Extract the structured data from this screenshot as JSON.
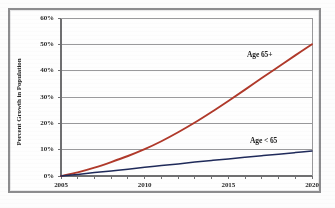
{
  "chart_data": {
    "type": "line",
    "title": "",
    "subtitle": "",
    "xlabel": "",
    "ylabel": "Percent Growth in Population",
    "xlim": [
      2005,
      2020
    ],
    "ylim": [
      0,
      60
    ],
    "grid": true,
    "grid_axis": "y",
    "legend_position": "inline-annotation",
    "x_tick_labels": [
      "2005",
      "2010",
      "2015",
      "2020"
    ],
    "x_tick_values": [
      2005,
      2010,
      2015,
      2020
    ],
    "y_tick_labels": [
      "0%",
      "10%",
      "20%",
      "30%",
      "40%",
      "50%",
      "60%"
    ],
    "y_tick_values": [
      0,
      10,
      20,
      30,
      40,
      50,
      60
    ],
    "y_unit": "%",
    "x": [
      2005,
      2006,
      2007,
      2008,
      2009,
      2010,
      2011,
      2012,
      2013,
      2014,
      2015,
      2016,
      2017,
      2018,
      2019,
      2020
    ],
    "series": [
      {
        "name": "Age 65+",
        "color": "#b0392a",
        "annotation": "Age 65+",
        "values": [
          0,
          1.4,
          3.2,
          5.3,
          7.6,
          10.2,
          13.2,
          16.6,
          20.3,
          24.3,
          28.5,
          32.8,
          37.2,
          41.5,
          45.8,
          50.0
        ]
      },
      {
        "name": "Age < 65",
        "color": "#1f2a5a",
        "annotation": "Age < 65",
        "values": [
          0,
          0.6,
          1.3,
          1.9,
          2.6,
          3.3,
          4.0,
          4.6,
          5.3,
          5.9,
          6.5,
          7.1,
          7.7,
          8.3,
          8.9,
          9.5
        ]
      }
    ]
  },
  "figure": {
    "frame_color": "#8d8d8f",
    "plot_background": "#ffffff",
    "gridline_color": "#9a9a9c",
    "axis_color": "#6f6f71",
    "tick_label_color": "#2a2a2a"
  }
}
